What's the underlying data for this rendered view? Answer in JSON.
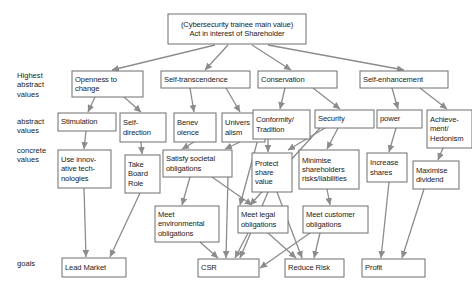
{
  "diagram": {
    "title_node": {
      "id": "root",
      "label": "(Cybersecurity trainee main value)\nAct in interest of Shareholder",
      "x": 168,
      "y": 14,
      "w": 138,
      "h": 30,
      "align": "center"
    },
    "row_labels": [
      {
        "id": "row-highest-abstract-values",
        "label": "Highest\nabstract\nvalues",
        "x": 17,
        "y": 71
      },
      {
        "id": "row-abstract-values",
        "label": "abstract\nvalues",
        "x": 17,
        "y": 117
      },
      {
        "id": "row-concrete-values",
        "label": "concrete\nvalues",
        "x": 17,
        "y": 146
      },
      {
        "id": "row-goals",
        "label": "goals",
        "x": 17,
        "y": 259
      }
    ],
    "nodes": [
      {
        "id": "openness-to-change",
        "label": "Openness to\nchange",
        "x": 72,
        "y": 71,
        "w": 71,
        "h": 26,
        "align": "left"
      },
      {
        "id": "self-transcendence",
        "label": "Self-transcendence",
        "x": 161,
        "y": 71,
        "w": 89,
        "h": 17,
        "align": "left"
      },
      {
        "id": "conservation",
        "label": "Conservation",
        "x": 258,
        "y": 71,
        "w": 79,
        "h": 17,
        "align": "left"
      },
      {
        "id": "self-enhancement",
        "label": "Self-enhancement",
        "x": 360,
        "y": 71,
        "w": 88,
        "h": 17,
        "align": "left"
      },
      {
        "id": "stimulation",
        "label": "Stimulation",
        "x": 58,
        "y": 113,
        "w": 58,
        "h": 18,
        "align": "left"
      },
      {
        "id": "self-direction",
        "label": "Self-\ndirection",
        "x": 120,
        "y": 113,
        "w": 46,
        "h": 29,
        "align": "left"
      },
      {
        "id": "benevolence",
        "label": "Benev\nolence",
        "x": 174,
        "y": 113,
        "w": 42,
        "h": 29,
        "align": "left"
      },
      {
        "id": "universalism",
        "label": "Univers\nalism",
        "x": 222,
        "y": 113,
        "w": 43,
        "h": 29,
        "align": "left"
      },
      {
        "id": "conformity-tradition",
        "label": "Conformity/\nTradition",
        "x": 253,
        "y": 110,
        "w": 57,
        "h": 29,
        "align": "left"
      },
      {
        "id": "security",
        "label": "Security",
        "x": 315,
        "y": 110,
        "w": 59,
        "h": 18,
        "align": "left"
      },
      {
        "id": "power",
        "label": "power",
        "x": 377,
        "y": 110,
        "w": 45,
        "h": 18,
        "align": "left"
      },
      {
        "id": "achievement-hedonism",
        "label": "Achieve-\nment/\nHedonism",
        "x": 427,
        "y": 110,
        "w": 45,
        "h": 38,
        "align": "left"
      },
      {
        "id": "use-innovative-technologies",
        "label": "Use innov-\native tech-\nnologies",
        "x": 58,
        "y": 150,
        "w": 53,
        "h": 38,
        "align": "left"
      },
      {
        "id": "take-board-role",
        "label": "Take\nBoard\nRole",
        "x": 125,
        "y": 155,
        "w": 35,
        "h": 38,
        "align": "left"
      },
      {
        "id": "satisfy-societal-obligations",
        "label": "Satisfy societal\nobligations",
        "x": 163,
        "y": 150,
        "w": 69,
        "h": 27,
        "align": "left"
      },
      {
        "id": "protect-share-value",
        "label": "Protect\nshare\nvalue",
        "x": 252,
        "y": 153,
        "w": 40,
        "h": 39,
        "align": "left"
      },
      {
        "id": "minimise-shareholders-risks",
        "label": "Minimise\nshareholders\nrisks/liabilities",
        "x": 299,
        "y": 150,
        "w": 60,
        "h": 39,
        "align": "left"
      },
      {
        "id": "increase-shares",
        "label": "Increase\nshares",
        "x": 367,
        "y": 153,
        "w": 40,
        "h": 29,
        "align": "left"
      },
      {
        "id": "maximise-dividend",
        "label": "Maximise\ndividend",
        "x": 413,
        "y": 161,
        "w": 46,
        "h": 28,
        "align": "left"
      },
      {
        "id": "meet-environmental-obligations",
        "label": "Meet\nenvironmental\nobligations",
        "x": 155,
        "y": 206,
        "w": 64,
        "h": 36,
        "align": "left"
      },
      {
        "id": "meet-legal-obligations",
        "label": "Meet legal\nobligations",
        "x": 238,
        "y": 206,
        "w": 50,
        "h": 27,
        "align": "left"
      },
      {
        "id": "meet-customer-obligations",
        "label": "Meet customer\nobligations",
        "x": 303,
        "y": 206,
        "w": 65,
        "h": 27,
        "align": "left"
      },
      {
        "id": "lead-market",
        "label": "Lead Market",
        "x": 62,
        "y": 258,
        "w": 64,
        "h": 19,
        "align": "left"
      },
      {
        "id": "csr",
        "label": "CSR",
        "x": 198,
        "y": 259,
        "w": 61,
        "h": 18,
        "align": "left"
      },
      {
        "id": "reduce-risk",
        "label": "Reduce Risk",
        "x": 285,
        "y": 259,
        "w": 59,
        "h": 18,
        "align": "left"
      },
      {
        "id": "profit",
        "label": "Profit",
        "x": 362,
        "y": 259,
        "w": 63,
        "h": 18,
        "align": "left"
      }
    ],
    "edges": [
      {
        "from": "root",
        "to": "openness-to-change",
        "x1": 215,
        "y1": 45,
        "x2": 112,
        "y2": 70
      },
      {
        "from": "root",
        "to": "self-transcendence",
        "x1": 228,
        "y1": 45,
        "x2": 205,
        "y2": 70
      },
      {
        "from": "root",
        "to": "conservation",
        "x1": 252,
        "y1": 45,
        "x2": 291,
        "y2": 70
      },
      {
        "from": "root",
        "to": "self-enhancement",
        "x1": 268,
        "y1": 45,
        "x2": 404,
        "y2": 70
      },
      {
        "from": "openness-to-change",
        "to": "stimulation",
        "x1": 95,
        "y1": 97,
        "x2": 88,
        "y2": 112
      },
      {
        "from": "openness-to-change",
        "to": "self-direction",
        "x1": 124,
        "y1": 97,
        "x2": 141,
        "y2": 112
      },
      {
        "from": "self-transcendence",
        "to": "benevolence",
        "x1": 190,
        "y1": 88,
        "x2": 194,
        "y2": 112
      },
      {
        "from": "self-transcendence",
        "to": "universalism",
        "x1": 226,
        "y1": 88,
        "x2": 240,
        "y2": 112
      },
      {
        "from": "conservation",
        "to": "conformity-tradition",
        "x1": 285,
        "y1": 88,
        "x2": 280,
        "y2": 109
      },
      {
        "from": "conservation",
        "to": "security",
        "x1": 313,
        "y1": 88,
        "x2": 340,
        "y2": 109
      },
      {
        "from": "self-enhancement",
        "to": "power",
        "x1": 392,
        "y1": 88,
        "x2": 398,
        "y2": 109
      },
      {
        "from": "self-enhancement",
        "to": "achievement-hedonism",
        "x1": 420,
        "y1": 88,
        "x2": 447,
        "y2": 109
      },
      {
        "from": "stimulation",
        "to": "use-innovative-technologies",
        "x1": 86,
        "y1": 131,
        "x2": 84,
        "y2": 149
      },
      {
        "from": "self-direction",
        "to": "take-board-role",
        "x1": 141,
        "y1": 142,
        "x2": 142,
        "y2": 154
      },
      {
        "from": "benevolence",
        "to": "satisfy-societal-obligations",
        "x1": 194,
        "y1": 142,
        "x2": 182,
        "y2": 149
      },
      {
        "from": "universalism",
        "to": "satisfy-societal-obligations",
        "x1": 240,
        "y1": 142,
        "x2": 225,
        "y2": 149
      },
      {
        "from": "conformity-tradition",
        "to": "protect-share-value",
        "x1": 268,
        "y1": 139,
        "x2": 268,
        "y2": 152
      },
      {
        "from": "conformity-tradition",
        "to": "meet-legal-obligations",
        "x1": 258,
        "y1": 139,
        "x2": 240,
        "y2": 205
      },
      {
        "from": "security",
        "to": "protect-share-value",
        "x1": 325,
        "y1": 128,
        "x2": 288,
        "y2": 150
      },
      {
        "from": "security",
        "to": "minimise-shareholders-risks",
        "x1": 338,
        "y1": 128,
        "x2": 327,
        "y2": 149
      },
      {
        "from": "security",
        "to": "meet-legal-obligations",
        "x1": 320,
        "y1": 128,
        "x2": 250,
        "y2": 205
      },
      {
        "from": "power",
        "to": "increase-shares",
        "x1": 396,
        "y1": 128,
        "x2": 389,
        "y2": 152
      },
      {
        "from": "achievement-hedonism",
        "to": "maximise-dividend",
        "x1": 443,
        "y1": 148,
        "x2": 438,
        "y2": 160
      },
      {
        "from": "use-innovative-technologies",
        "to": "lead-market",
        "x1": 84,
        "y1": 188,
        "x2": 86,
        "y2": 257
      },
      {
        "from": "take-board-role",
        "to": "lead-market",
        "x1": 140,
        "y1": 193,
        "x2": 110,
        "y2": 257
      },
      {
        "from": "satisfy-societal-obligations",
        "to": "meet-environmental-obligations",
        "x1": 190,
        "y1": 177,
        "x2": 182,
        "y2": 205
      },
      {
        "from": "satisfy-societal-obligations",
        "to": "meet-legal-obligations",
        "x1": 212,
        "y1": 177,
        "x2": 252,
        "y2": 205
      },
      {
        "from": "satisfy-societal-obligations",
        "to": "csr",
        "x1": 228,
        "y1": 177,
        "x2": 226,
        "y2": 258
      },
      {
        "from": "protect-share-value",
        "to": "reduce-risk",
        "x1": 277,
        "y1": 192,
        "x2": 302,
        "y2": 258
      },
      {
        "from": "protect-share-value",
        "to": "csr",
        "x1": 268,
        "y1": 192,
        "x2": 240,
        "y2": 258
      },
      {
        "from": "minimise-shareholders-risks",
        "to": "meet-customer-obligations",
        "x1": 327,
        "y1": 189,
        "x2": 330,
        "y2": 205
      },
      {
        "from": "meet-environmental-obligations",
        "to": "csr",
        "x1": 200,
        "y1": 242,
        "x2": 218,
        "y2": 258
      },
      {
        "from": "meet-legal-obligations",
        "to": "csr",
        "x1": 248,
        "y1": 233,
        "x2": 235,
        "y2": 258
      },
      {
        "from": "meet-legal-obligations",
        "to": "reduce-risk",
        "x1": 268,
        "y1": 233,
        "x2": 296,
        "y2": 258
      },
      {
        "from": "meet-customer-obligations",
        "to": "reduce-risk",
        "x1": 320,
        "y1": 233,
        "x2": 314,
        "y2": 258
      },
      {
        "from": "meet-customer-obligations",
        "to": "csr",
        "x1": 310,
        "y1": 233,
        "x2": 260,
        "y2": 268
      },
      {
        "from": "increase-shares",
        "to": "profit",
        "x1": 389,
        "y1": 182,
        "x2": 381,
        "y2": 258
      },
      {
        "from": "maximise-dividend",
        "to": "profit",
        "x1": 424,
        "y1": 189,
        "x2": 402,
        "y2": 258
      }
    ]
  }
}
